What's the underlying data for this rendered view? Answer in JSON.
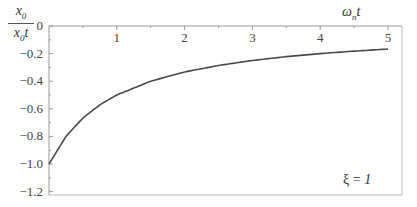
{
  "chart_data": {
    "type": "line",
    "title": "",
    "ylabel": {
      "numerator": "x0",
      "denominator": "ẋ0t"
    },
    "xlabel": "ωnt",
    "xlim": [
      0,
      5
    ],
    "ylim": [
      -1.2,
      0
    ],
    "x_ticks": [
      "1",
      "2",
      "3",
      "4",
      "5"
    ],
    "y_ticks": [
      "0",
      "-0.2",
      "-0.4",
      "-0.6",
      "-0.8",
      "-1.0",
      "-1.2"
    ],
    "annotation": "ξ = 1",
    "grid": false,
    "series": [
      {
        "name": "ξ = 1",
        "x": [
          0,
          0.25,
          0.5,
          0.75,
          1,
          1.5,
          2,
          2.5,
          3,
          3.5,
          4,
          4.5,
          5
        ],
        "y": [
          -1.0,
          -0.8,
          -0.667,
          -0.571,
          -0.5,
          -0.4,
          -0.333,
          -0.286,
          -0.25,
          -0.222,
          -0.2,
          -0.182,
          -0.167
        ]
      }
    ]
  },
  "labels": {
    "y_num": "x",
    "y_num_sub": "0",
    "y_den": "x",
    "y_den_sub": "0",
    "y_den_t": "t",
    "x_main": "ω",
    "x_sub": "n",
    "x_t": "t",
    "annot_prefix": "ξ = ",
    "annot_value": "1"
  }
}
